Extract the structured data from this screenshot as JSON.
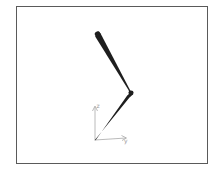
{
  "figure": {
    "frame_border_color": "#5a5a5a",
    "link_color": "#1e1e1e",
    "axis_color": "#a0a0a0"
  },
  "arm": {
    "base": {
      "x": 95,
      "y": 140
    },
    "joint": {
      "x": 130,
      "y": 92
    },
    "tip": {
      "x": 97,
      "y": 33
    }
  },
  "axes": {
    "origin": {
      "x": 95,
      "y": 140
    },
    "vertical_label": "z",
    "horizontal_label": "y"
  }
}
